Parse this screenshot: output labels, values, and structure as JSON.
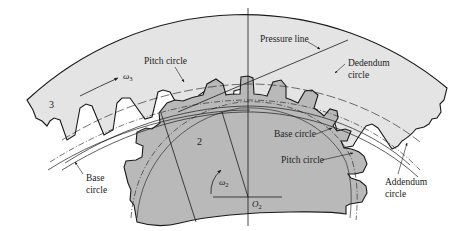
{
  "figure": {
    "type": "internal gear mesh diagram",
    "colors": {
      "ring_gear_fill": "#e4e4e4",
      "pinion_fill": "#b9b9b9",
      "line": "#1a1a1a",
      "background": "#ffffff"
    },
    "gears": {
      "ring": {
        "number": "3",
        "angular_velocity": "ω",
        "angular_velocity_sub": "3"
      },
      "pinion": {
        "number": "2",
        "angular_velocity": "ω",
        "angular_velocity_sub": "2",
        "center": "O",
        "center_sub": "2"
      }
    },
    "labels": {
      "pitch_circle_ring": "Pitch circle",
      "pressure_line": "Pressure line",
      "dedendum_circle_1": "Dedendum",
      "dedendum_circle_2": "circle",
      "base_circle_ring_1": "Base",
      "base_circle_ring_2": "circle",
      "base_circle_pinion": "Base circle",
      "pitch_circle_pinion": "Pitch circle",
      "addendum_circle_1": "Addendum",
      "addendum_circle_2": "circle"
    }
  }
}
